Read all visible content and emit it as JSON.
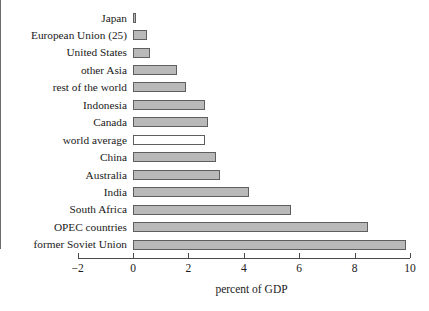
{
  "chart_data": {
    "type": "bar",
    "orientation": "horizontal",
    "title": "",
    "subtitle": "",
    "xlabel": "percent of GDP",
    "ylabel": "",
    "xlim": [
      -2,
      10
    ],
    "xticks": [
      -2,
      0,
      2,
      4,
      6,
      8,
      10
    ],
    "xtick_labels": [
      "−2",
      "0",
      "2",
      "4",
      "6",
      "8",
      "10"
    ],
    "grid": false,
    "legend": null,
    "categories": [
      "Japan",
      "European Union (25)",
      "United States",
      "other Asia",
      "rest of the world",
      "Indonesia",
      "Canada",
      "world average",
      "China",
      "Australia",
      "India",
      "South Africa",
      "OPEC countries",
      "former Soviet Union"
    ],
    "values": [
      0.1,
      0.5,
      0.6,
      1.6,
      1.9,
      2.6,
      2.7,
      2.6,
      3.0,
      3.15,
      4.2,
      5.7,
      8.5,
      9.85
    ],
    "highlighted_category": "world average",
    "bar_fill": "#b9b9b9",
    "bar_fill_highlight": "#ffffff",
    "bar_border": "#5f5f5f",
    "axis_color": "#4a4a4a",
    "background": "#ffffff"
  }
}
